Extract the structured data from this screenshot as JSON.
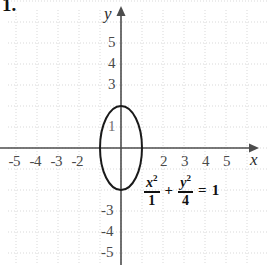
{
  "problem": {
    "number": "1."
  },
  "graph": {
    "axes": {
      "x_label": "x",
      "y_label": "y",
      "origin_px": {
        "x": 121,
        "y": 148
      },
      "unit_px": 21,
      "x_axis_color": "#4d4d4d",
      "y_axis_color": "#4d4d4d",
      "grid_color": "#d9d9d9",
      "grid": "dotted"
    },
    "x_ticks": [
      {
        "label": "-5",
        "value": -5
      },
      {
        "label": "-4",
        "value": -4
      },
      {
        "label": "-3",
        "value": -3
      },
      {
        "label": "-2",
        "value": -2
      },
      {
        "label": "2",
        "value": 2
      },
      {
        "label": "3",
        "value": 3
      },
      {
        "label": "4",
        "value": 4
      },
      {
        "label": "5",
        "value": 5
      }
    ],
    "y_ticks": [
      {
        "label": "5",
        "value": 5
      },
      {
        "label": "4",
        "value": 4
      },
      {
        "label": "3",
        "value": 3
      },
      {
        "label": "1",
        "value": 1
      },
      {
        "label": "-3",
        "value": -3
      },
      {
        "label": "-4",
        "value": -4
      },
      {
        "label": "-5",
        "value": -5
      }
    ]
  },
  "curve": {
    "type": "ellipse",
    "center": {
      "x": 0,
      "y": 0
    },
    "semi_axis_x": 1,
    "semi_axis_y": 2,
    "stroke_color": "#1a1a1a",
    "stroke_width": 2
  },
  "equation": {
    "numerator_1": "x",
    "numerator_1_exp": "2",
    "denominator_1": "1",
    "operator": "+",
    "numerator_2": "y",
    "numerator_2_exp": "2",
    "denominator_2": "4",
    "equals": "=",
    "right_side": "1",
    "plain_text": "x^2/1 + y^2/4 = 1"
  }
}
